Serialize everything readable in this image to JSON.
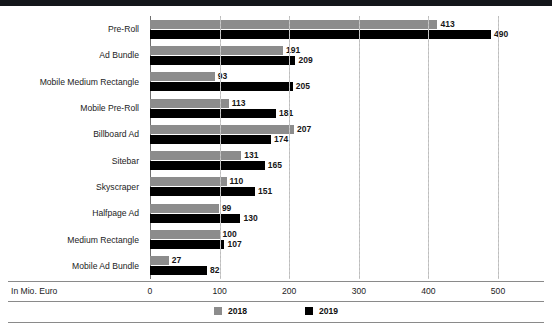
{
  "chart_data": {
    "type": "bar",
    "orientation": "horizontal",
    "title": "",
    "xlabel": "In Mio. Euro",
    "ylabel": "",
    "xlim": [
      0,
      520
    ],
    "ticks": [
      0,
      100,
      200,
      300,
      400,
      500
    ],
    "grid": true,
    "legend_position": "bottom",
    "categories": [
      "Pre-Roll",
      "Ad Bundle",
      "Mobile Medium Rectangle",
      "Mobile Pre-Roll",
      "Billboard Ad",
      "Sitebar",
      "Skyscraper",
      "Halfpage Ad",
      "Medium Rectangle",
      "Mobile Ad Bundle"
    ],
    "series": [
      {
        "name": "2018",
        "color": "#8c8c8c",
        "values": [
          413,
          191,
          93,
          113,
          207,
          131,
          110,
          99,
          100,
          27
        ]
      },
      {
        "name": "2019",
        "color": "#000000",
        "values": [
          490,
          209,
          205,
          181,
          174,
          165,
          151,
          130,
          107,
          82
        ]
      }
    ]
  },
  "axis": {
    "label": "In Mio. Euro",
    "tick_labels": [
      "0",
      "100",
      "200",
      "300",
      "400",
      "500"
    ]
  },
  "legend": {
    "items": [
      {
        "label": "2018",
        "color": "#8c8c8c"
      },
      {
        "label": "2019",
        "color": "#000000"
      }
    ]
  },
  "source": {
    "text": ""
  }
}
